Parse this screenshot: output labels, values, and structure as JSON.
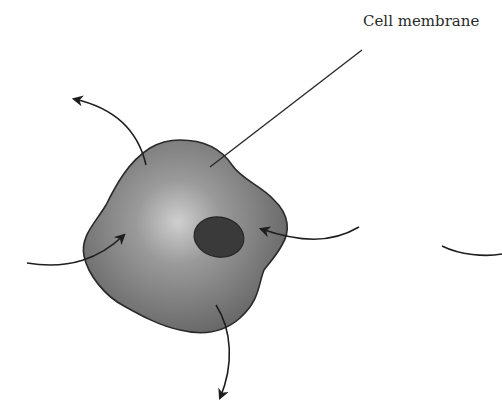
{
  "diagram": {
    "labels": {
      "cell_membrane": "Cell membrane"
    },
    "parts": [
      "cell-body",
      "nucleus",
      "cell-membrane-leader-line"
    ],
    "arrows": [
      {
        "name": "outward-arrow-top-left",
        "direction": "out"
      },
      {
        "name": "inward-arrow-left",
        "direction": "in"
      },
      {
        "name": "inward-arrow-right",
        "direction": "in"
      },
      {
        "name": "outward-arrow-bottom",
        "direction": "out"
      },
      {
        "name": "partial-arc-right-edge",
        "direction": "none"
      }
    ],
    "colors": {
      "cell_fill_center": "#c8c8c8",
      "cell_fill_edge": "#6a6a6a",
      "cell_outline": "#2a2a2a",
      "nucleus_fill": "#3a3a3a",
      "arrow_stroke": "#1e1e1e",
      "background": "#ffffff"
    }
  }
}
